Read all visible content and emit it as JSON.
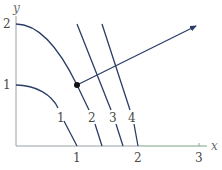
{
  "diagram": {
    "title": "",
    "axes": {
      "x_label": "x",
      "y_label": "y",
      "x_ticks": [
        "1",
        "2",
        "3"
      ],
      "y_ticks": [
        "1",
        "2"
      ],
      "x_range": [
        0,
        3.1
      ],
      "y_range": [
        0,
        2.2
      ]
    },
    "level_curves": [
      {
        "label": "1",
        "equation": "x^2 + y = 1"
      },
      {
        "label": "2",
        "equation": "x^2 + y = 2"
      },
      {
        "label": "3",
        "equation": "x^2 + y = 3"
      },
      {
        "label": "4",
        "equation": "x^2 + y = 4"
      }
    ],
    "point": {
      "x": 1,
      "y": 1
    },
    "gradient_arrow": {
      "from": [
        1,
        1
      ],
      "to": [
        2.97,
        1.98
      ]
    },
    "colors": {
      "curve": "#2c3e66",
      "axis": "#9aa0a6",
      "axis_right_tint": "#a9d6a9",
      "text": "#4a4a4a"
    }
  }
}
